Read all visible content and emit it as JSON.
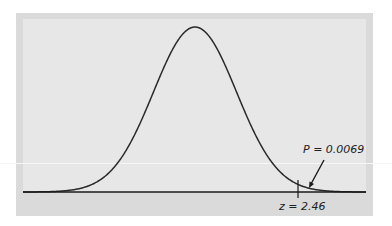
{
  "chart_data": {
    "type": "line",
    "title": "",
    "xlabel": "",
    "ylabel": "",
    "distribution": "standard normal",
    "mean": 0,
    "sd": 1,
    "grid": false,
    "legend": null,
    "shaded_region": {
      "from_z": 2.46,
      "to_z": "infinity",
      "tail": "right"
    },
    "annotations": [
      {
        "text": "P = 0.0069",
        "points_to": "right tail area beyond z = 2.46"
      },
      {
        "text": "z = 2.46",
        "marks": "tick on horizontal axis"
      }
    ],
    "x": [
      -3.5,
      -3,
      -2.5,
      -2,
      -1.5,
      -1,
      -0.5,
      0,
      0.5,
      1,
      1.5,
      2,
      2.46,
      2.5,
      3,
      3.5
    ],
    "values": [
      0.0009,
      0.0044,
      0.0175,
      0.054,
      0.1295,
      0.242,
      0.3521,
      0.3989,
      0.3521,
      0.242,
      0.1295,
      0.054,
      0.0194,
      0.0175,
      0.0044,
      0.0009
    ]
  },
  "labels": {
    "p_value": "P = 0.0069",
    "z_value": "z = 2.46"
  },
  "colors": {
    "curve": "#2a2a2a",
    "axis": "#1a1a1a",
    "panel": "#e7e7e7",
    "border": "#dadada"
  }
}
